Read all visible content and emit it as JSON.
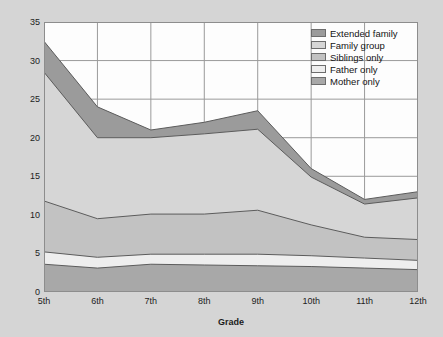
{
  "chart_data": {
    "type": "area",
    "title": "",
    "xlabel": "Grade",
    "ylabel": "Percent of waking hours (non-school)",
    "categories": [
      "5th",
      "6th",
      "7th",
      "8th",
      "9th",
      "10th",
      "11th",
      "12th"
    ],
    "ylim": [
      0,
      35
    ],
    "yticks": [
      0,
      5,
      10,
      15,
      20,
      25,
      30,
      35
    ],
    "grid": true,
    "stacked": true,
    "legend_position": "top-right",
    "series": [
      {
        "name": "Mother only",
        "color": "#a8a8a8",
        "values": [
          3.6,
          3.1,
          3.6,
          3.5,
          3.4,
          3.3,
          3.1,
          2.9
        ]
      },
      {
        "name": "Father only",
        "color": "#eeeeee",
        "values": [
          1.6,
          1.4,
          1.3,
          1.4,
          1.5,
          1.4,
          1.3,
          1.2
        ]
      },
      {
        "name": "Siblings only",
        "color": "#c2c2c2",
        "values": [
          6.6,
          5.0,
          5.2,
          5.2,
          5.7,
          4.0,
          2.7,
          2.7
        ]
      },
      {
        "name": "Family group",
        "color": "#d6d6d6",
        "values": [
          16.7,
          10.5,
          9.9,
          10.4,
          10.5,
          6.2,
          4.3,
          5.4
        ]
      },
      {
        "name": "Extended family",
        "color": "#9b9b9b",
        "values": [
          4.0,
          4.0,
          1.0,
          1.5,
          2.4,
          1.1,
          0.6,
          0.8
        ]
      }
    ],
    "totals": [
      32.5,
      24.0,
      21.0,
      22.0,
      23.5,
      16.0,
      12.0,
      13.0
    ]
  },
  "legend": {
    "items": [
      {
        "label": "Extended family"
      },
      {
        "label": "Family group"
      },
      {
        "label": "Siblings only"
      },
      {
        "label": "Father only"
      },
      {
        "label": "Mother only"
      }
    ]
  }
}
